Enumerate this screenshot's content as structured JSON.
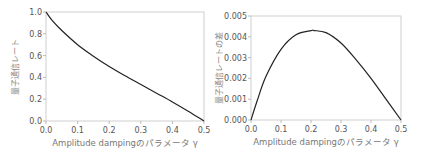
{
  "chart_data": [
    {
      "type": "line",
      "title": "",
      "xlabel": "Amplitude dampingのパラメータ γ",
      "ylabel": "量子通信レート",
      "xlim": [
        0.0,
        0.5
      ],
      "ylim": [
        0.0,
        1.0
      ],
      "xticks": [
        "0.0",
        "0.1",
        "0.2",
        "0.3",
        "0.4",
        "0.5"
      ],
      "yticks": [
        "0.0",
        "0.2",
        "0.4",
        "0.6",
        "0.8",
        "1.0"
      ],
      "grid": false,
      "x": [
        0.0,
        0.02,
        0.05,
        0.1,
        0.15,
        0.2,
        0.25,
        0.3,
        0.35,
        0.4,
        0.45,
        0.5
      ],
      "series": [
        {
          "name": "量子通信レート",
          "values": [
            1.0,
            0.92,
            0.83,
            0.7,
            0.595,
            0.5,
            0.415,
            0.335,
            0.255,
            0.175,
            0.09,
            0.0
          ]
        }
      ]
    },
    {
      "type": "line",
      "title": "",
      "xlabel": "Amplitude dampingのパラメータ γ",
      "ylabel": "量子通信レートの差",
      "xlim": [
        0.0,
        0.5
      ],
      "ylim": [
        0.0,
        0.005
      ],
      "xticks": [
        "0.0",
        "0.1",
        "0.2",
        "0.3",
        "0.4",
        "0.5"
      ],
      "yticks": [
        "0.000",
        "0.001",
        "0.002",
        "0.003",
        "0.004",
        "0.005"
      ],
      "grid": false,
      "x": [
        0.0,
        0.02,
        0.05,
        0.1,
        0.15,
        0.2,
        0.21,
        0.25,
        0.3,
        0.35,
        0.4,
        0.45,
        0.5
      ],
      "series": [
        {
          "name": "量子通信レートの差",
          "values": [
            0.0,
            0.0009,
            0.0021,
            0.0034,
            0.0041,
            0.0043,
            0.0043,
            0.0042,
            0.0037,
            0.0029,
            0.002,
            0.001,
            0.0
          ]
        }
      ]
    }
  ]
}
